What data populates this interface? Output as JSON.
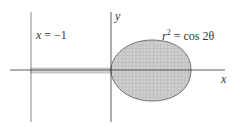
{
  "figure": {
    "curve_label": {
      "lhs": "r",
      "exp": "2",
      "rhs": " = cos 2θ"
    },
    "line_label": {
      "var": "x",
      "rest": " = −1"
    },
    "axes": {
      "x": "x",
      "y": "y"
    },
    "colors": {
      "fill": "#c8c8c8",
      "axis": "#333333",
      "grid": "#999999"
    }
  }
}
